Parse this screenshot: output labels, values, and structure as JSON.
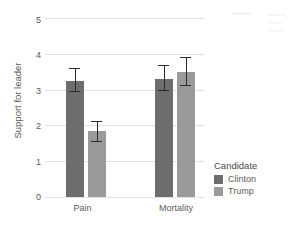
{
  "chart_data": {
    "type": "bar",
    "title": "",
    "subtitle": "",
    "xlabel": "",
    "ylabel": "Support for leader",
    "categories": [
      "Pain",
      "Mortality"
    ],
    "ylim": [
      0,
      5
    ],
    "yticks": [
      0,
      1,
      2,
      3,
      4,
      5
    ],
    "ytick_labels": [
      "0",
      "1",
      "2",
      "3",
      "4",
      "5"
    ],
    "grid": true,
    "grid_axis": "y",
    "legend": {
      "title": "Candidate",
      "position": "right",
      "entries": [
        "Clinton",
        "Trump"
      ]
    },
    "series": [
      {
        "name": "Clinton",
        "color": "#6d6d6d",
        "values": [
          3.25,
          3.3
        ],
        "error_low": [
          2.92,
          2.95
        ],
        "error_high": [
          3.58,
          3.67
        ]
      },
      {
        "name": "Trump",
        "color": "#9a9a9a",
        "values": [
          1.85,
          3.5
        ],
        "error_low": [
          1.55,
          3.1
        ],
        "error_high": [
          2.1,
          3.87
        ]
      }
    ],
    "errorbars": true,
    "errorbar_description": "vertical capped error bars"
  },
  "axis": {
    "y_title": "Support for leader",
    "y_tick_0": "0",
    "y_tick_1": "1",
    "y_tick_2": "2",
    "y_tick_3": "3",
    "y_tick_4": "4",
    "y_tick_5": "5",
    "x_cat_0": "Pain",
    "x_cat_1": "Mortality"
  },
  "legend": {
    "title": "Candidate",
    "item_0": "Clinton",
    "item_1": "Trump"
  },
  "colors": {
    "clinton": "#6d6d6d",
    "trump": "#9a9a9a",
    "grid": "#e6e6e6",
    "text": "#5a5a5a",
    "panel_bg": "#ffffff",
    "page_bg": "#ffffff",
    "errorbar": "#2b2b2b"
  }
}
